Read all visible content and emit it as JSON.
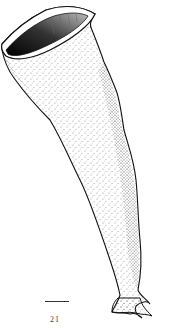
{
  "figure": {
    "label": "21",
    "scale_bar": true
  },
  "colors": {
    "ink": "#111111",
    "background": "#ffffff"
  }
}
